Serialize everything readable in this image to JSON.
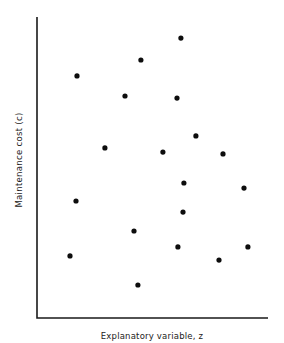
{
  "chart_data": {
    "type": "scatter",
    "title": "",
    "xlabel": "Explanatory variable, z",
    "ylabel": "Maintenance cost (c)",
    "grid": false,
    "legend": null,
    "ticks": {
      "x": [],
      "y": []
    },
    "xlim": [
      0,
      100
    ],
    "ylim": [
      0,
      100
    ],
    "points": [
      {
        "x": 62.3,
        "y": 93.3
      },
      {
        "x": 45.0,
        "y": 86.0
      },
      {
        "x": 17.3,
        "y": 80.7
      },
      {
        "x": 38.1,
        "y": 74.0
      },
      {
        "x": 60.6,
        "y": 73.3
      },
      {
        "x": 68.8,
        "y": 60.7
      },
      {
        "x": 29.4,
        "y": 56.7
      },
      {
        "x": 54.5,
        "y": 55.3
      },
      {
        "x": 80.5,
        "y": 54.7
      },
      {
        "x": 63.6,
        "y": 45.0
      },
      {
        "x": 89.6,
        "y": 43.3
      },
      {
        "x": 16.9,
        "y": 39.0
      },
      {
        "x": 63.2,
        "y": 35.3
      },
      {
        "x": 42.0,
        "y": 29.0
      },
      {
        "x": 61.0,
        "y": 23.7
      },
      {
        "x": 91.3,
        "y": 23.7
      },
      {
        "x": 14.3,
        "y": 20.7
      },
      {
        "x": 78.8,
        "y": 19.3
      },
      {
        "x": 43.7,
        "y": 11.0
      }
    ]
  },
  "labels": {
    "x_axis": "Explanatory variable, z",
    "y_axis": "Maintenance cost (c)"
  }
}
